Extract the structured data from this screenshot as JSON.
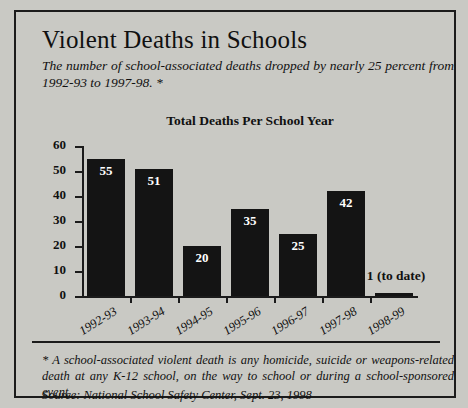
{
  "headline": "Violent Deaths in Schools",
  "subtitle": "The number of school-associated deaths dropped by nearly 25 percent from 1992-93 to 1997-98. *",
  "footnote": "* A school-associated violent death is any homicide, suicide or weapons-related death at any K-12 school, on the way to school or during a school-sponsored event.",
  "source": "Source: National School Safety Center, Sept. 23, 1998",
  "colors": {
    "background": "#c9c9c4",
    "bar": "#141414",
    "ink": "#101010",
    "bar_label": "#ffffff"
  },
  "chart_data": {
    "type": "bar",
    "title": "Total Deaths Per School Year",
    "xlabel": "",
    "ylabel": "",
    "ylim": [
      0,
      60
    ],
    "yticks": [
      0,
      10,
      20,
      30,
      40,
      50,
      60
    ],
    "grid": false,
    "legend": false,
    "categories": [
      "1992-93",
      "1993-94",
      "1994-95",
      "1995-96",
      "1996-97",
      "1997-98",
      "1998-99"
    ],
    "values": [
      55,
      51,
      20,
      35,
      25,
      42,
      1
    ],
    "data_labels": [
      "55",
      "51",
      "20",
      "35",
      "25",
      "42",
      "1 (to date)"
    ],
    "annotations": [
      {
        "category": "1998-99",
        "text": "1 (to date)",
        "placement": "outside-right-of-bar"
      }
    ]
  }
}
